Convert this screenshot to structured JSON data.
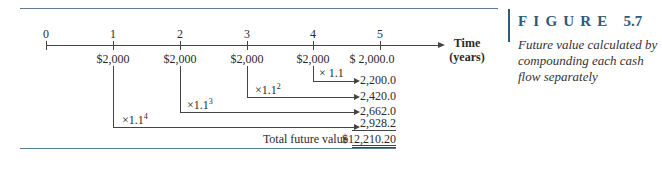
{
  "figure": {
    "title_letters": "FIGURE",
    "number": "5.7",
    "caption": "Future value calculated by compounding each cash flow separately",
    "accent_color": "#2f5a78"
  },
  "timeline": {
    "axis_label_line1": "Time",
    "axis_label_line2": "(years)",
    "ticks": [
      "0",
      "1",
      "2",
      "3",
      "4",
      "5"
    ],
    "cash_flows": [
      "$2,000",
      "$2,000",
      "$2,000",
      "$2,000",
      "$ 2,000.0"
    ]
  },
  "compounding": [
    {
      "from_year": "4",
      "multiplier": "× 1.1",
      "exponent": "",
      "value": "2,200.0"
    },
    {
      "from_year": "3",
      "multiplier": "×1.1",
      "exponent": "2",
      "value": "2,420.0"
    },
    {
      "from_year": "2",
      "multiplier": "×1.1",
      "exponent": "3",
      "value": "2,662.0"
    },
    {
      "from_year": "1",
      "multiplier": "×1.1",
      "exponent": "4",
      "value": "2,928.2"
    }
  ],
  "total": {
    "label": "Total future value",
    "value": "$12,210.20"
  }
}
